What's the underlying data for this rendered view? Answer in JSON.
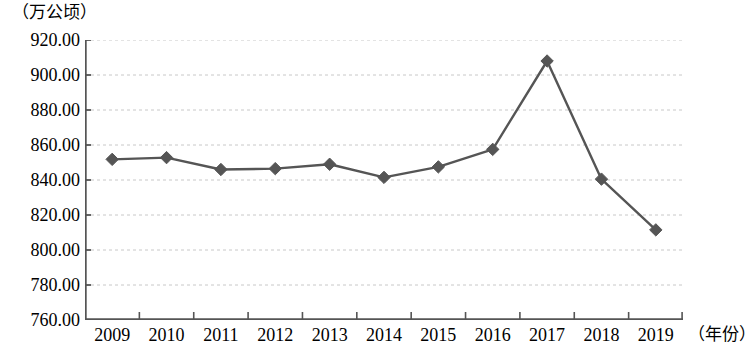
{
  "chart_data": {
    "type": "line",
    "title": "",
    "subtitle": "",
    "xlabel": "（年份）",
    "ylabel": "（万公顷）",
    "categories": [
      "2009",
      "2010",
      "2011",
      "2012",
      "2013",
      "2014",
      "2015",
      "2016",
      "2017",
      "2018",
      "2019"
    ],
    "values": [
      851.8,
      852.8,
      846.0,
      846.5,
      849.0,
      841.5,
      847.5,
      857.5,
      908.0,
      840.5,
      811.5
    ],
    "series": [
      {
        "name": "",
        "values": [
          851.8,
          852.8,
          846.0,
          846.5,
          849.0,
          841.5,
          847.5,
          857.5,
          908.0,
          840.5,
          811.5
        ]
      }
    ],
    "ylim": [
      760,
      920
    ],
    "ytick_step": 20,
    "ytick_labels": [
      "920.00",
      "900.00",
      "880.00",
      "860.00",
      "840.00",
      "820.00",
      "800.00",
      "780.00",
      "760.00"
    ],
    "ytick_values": [
      920,
      900,
      880,
      860,
      840,
      820,
      800,
      780,
      760
    ],
    "grid": true,
    "grid_style": "dashed-horizontal",
    "legend": "none",
    "marker": "diamond",
    "line_color": "#555555",
    "marker_color": "#555555",
    "grid_color": "#c8c8c8",
    "axis_color": "#555555"
  }
}
